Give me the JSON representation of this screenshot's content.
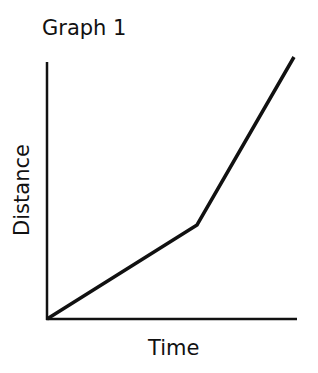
{
  "chart_data": {
    "type": "line",
    "title": "Graph 1",
    "xlabel": "Time",
    "ylabel": "Distance",
    "grid": false,
    "legend": null,
    "ticks": false,
    "axis_pixels": {
      "origin": [
        47,
        319
      ],
      "x_end": [
        297,
        319
      ],
      "y_end": [
        47,
        62
      ]
    },
    "series": [
      {
        "name": "distance-time",
        "points_px": [
          [
            47,
            319
          ],
          [
            197,
            225
          ],
          [
            294,
            57
          ]
        ],
        "points_relative": [
          [
            0,
            0
          ],
          [
            0.6,
            0.37
          ],
          [
            0.99,
            1.0
          ]
        ]
      }
    ]
  }
}
